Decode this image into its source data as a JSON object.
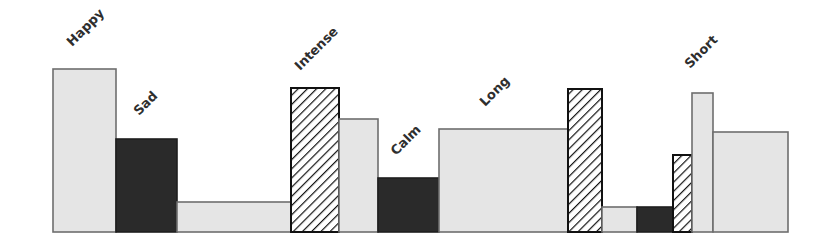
{
  "chart_data": {
    "type": "bar",
    "variant": "variable-width bars, no axes",
    "title": "",
    "xlabel": "",
    "ylabel": "",
    "grid": false,
    "legend": null,
    "baseline_y": 232,
    "categories": [
      "Happy",
      "Sad",
      "Intense",
      "Calm",
      "Long",
      "Short"
    ],
    "styles": {
      "light": {
        "fill": "#e5e5e5",
        "stroke": "#6e6e6e"
      },
      "dark": {
        "fill": "#2a2a2a",
        "stroke": "#1e1e1e"
      },
      "hatched": {
        "fill": "diagonal black hatch on white",
        "stroke": "#111111"
      }
    },
    "bars": [
      {
        "x": 53,
        "width": 63,
        "height": 163,
        "style": "light",
        "label": "Happy"
      },
      {
        "x": 116,
        "width": 61,
        "height": 93,
        "style": "dark",
        "label": "Sad"
      },
      {
        "x": 177,
        "width": 114,
        "height": 30,
        "style": "light",
        "label": ""
      },
      {
        "x": 291,
        "width": 48,
        "height": 144,
        "style": "hatched",
        "label": "Intense"
      },
      {
        "x": 339,
        "width": 39,
        "height": 113,
        "style": "light",
        "label": ""
      },
      {
        "x": 378,
        "width": 61,
        "height": 54,
        "style": "dark",
        "label": "Calm"
      },
      {
        "x": 439,
        "width": 129,
        "height": 103,
        "style": "light",
        "label": "Long"
      },
      {
        "x": 568,
        "width": 34,
        "height": 143,
        "style": "hatched",
        "label": ""
      },
      {
        "x": 602,
        "width": 35,
        "height": 25,
        "style": "light",
        "label": ""
      },
      {
        "x": 637,
        "width": 36,
        "height": 25,
        "style": "dark",
        "label": ""
      },
      {
        "x": 673,
        "width": 19,
        "height": 77,
        "style": "hatched",
        "label": ""
      },
      {
        "x": 692,
        "width": 21,
        "height": 139,
        "style": "light",
        "label": "Short"
      },
      {
        "x": 713,
        "width": 75,
        "height": 100,
        "style": "light",
        "label": ""
      }
    ],
    "labels": [
      {
        "text": "Happy",
        "x": 72,
        "y": 47,
        "rotate": -45
      },
      {
        "text": "Sad",
        "x": 139,
        "y": 116,
        "rotate": -45
      },
      {
        "text": "Intense",
        "x": 300,
        "y": 71,
        "rotate": -45
      },
      {
        "text": "Calm",
        "x": 396,
        "y": 156,
        "rotate": -45
      },
      {
        "text": "Long",
        "x": 485,
        "y": 107,
        "rotate": -45
      },
      {
        "text": "Short",
        "x": 690,
        "y": 69,
        "rotate": -45
      }
    ]
  }
}
